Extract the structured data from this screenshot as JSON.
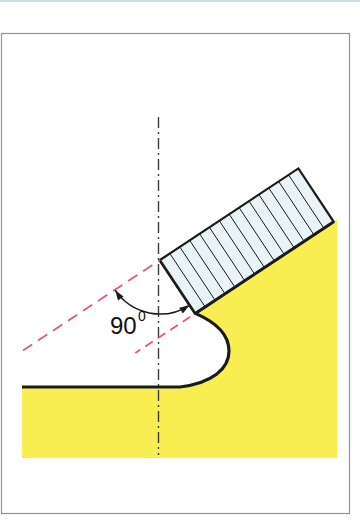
{
  "annotation": {
    "angle_value": "90",
    "angle_superscript": "0"
  },
  "colors": {
    "material_yellow": "#f8ee52",
    "plate_fill": "#eaf4f6",
    "line_dark": "#1b1b1b",
    "centerline_gray": "#3c3c3c",
    "reference_red": "#e25778",
    "frame_gray": "#949494",
    "page_edge_blue": "#ccdbe2",
    "label_black": "#111111"
  }
}
